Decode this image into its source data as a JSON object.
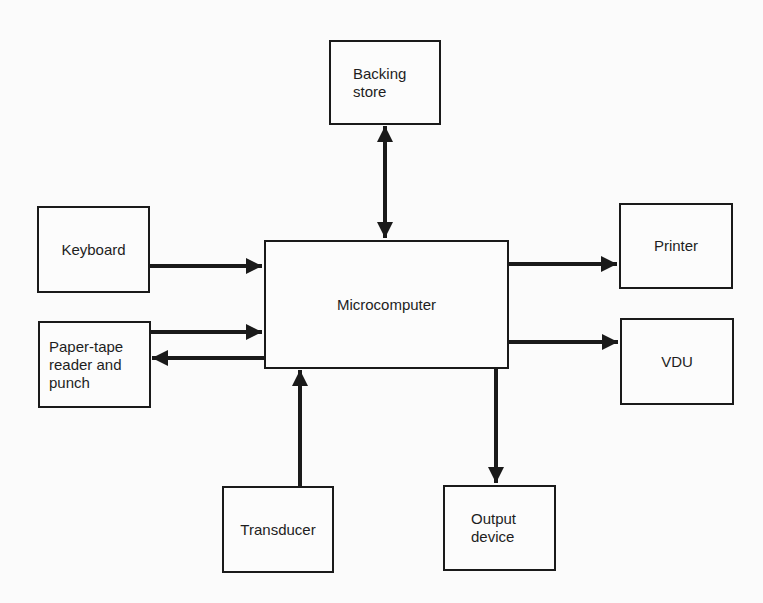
{
  "diagram": {
    "type": "block-diagram",
    "nodes": {
      "backing_store": {
        "label": "Backing\nstore"
      },
      "keyboard": {
        "label": "Keyboard"
      },
      "microcomputer": {
        "label": "Microcomputer"
      },
      "printer": {
        "label": "Printer"
      },
      "paper_tape": {
        "label": "Paper-tape\nreader and\npunch"
      },
      "vdu": {
        "label": "VDU"
      },
      "transducer": {
        "label": "Transducer"
      },
      "output_device": {
        "label": "Output\ndevice"
      }
    },
    "edges": [
      {
        "from": "keyboard",
        "to": "microcomputer",
        "direction": "one-way"
      },
      {
        "from": "paper_tape",
        "to": "microcomputer",
        "direction": "one-way"
      },
      {
        "from": "microcomputer",
        "to": "paper_tape",
        "direction": "one-way"
      },
      {
        "from": "backing_store",
        "to": "microcomputer",
        "direction": "two-way"
      },
      {
        "from": "microcomputer",
        "to": "printer",
        "direction": "one-way"
      },
      {
        "from": "microcomputer",
        "to": "vdu",
        "direction": "one-way"
      },
      {
        "from": "transducer",
        "to": "microcomputer",
        "direction": "one-way"
      },
      {
        "from": "microcomputer",
        "to": "output_device",
        "direction": "one-way"
      }
    ],
    "colors": {
      "background": "#fbfbfb",
      "line": "#1a1a1a"
    }
  }
}
